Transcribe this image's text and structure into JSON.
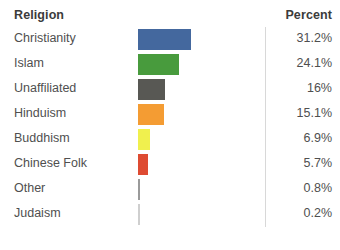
{
  "header": {
    "category_label": "Religion",
    "value_label": "Percent"
  },
  "chart_data": {
    "type": "bar",
    "orientation": "horizontal",
    "title": "",
    "xlabel": "Percent",
    "ylabel": "Religion",
    "grid": false,
    "legend": false,
    "xlim": [
      0,
      31.2
    ],
    "categories": [
      "Christianity",
      "Islam",
      "Unaffiliated",
      "Hinduism",
      "Buddhism",
      "Chinese Folk",
      "Other",
      "Judaism"
    ],
    "values": [
      31.2,
      24.1,
      16,
      15.1,
      6.9,
      5.7,
      0.8,
      0.2
    ],
    "value_labels": [
      "31.2%",
      "24.1%",
      "16%",
      "15.1%",
      "6.9%",
      "5.7%",
      "0.8%",
      "0.2%"
    ],
    "colors": [
      "#44689e",
      "#489b3d",
      "#585854",
      "#f49c33",
      "#f0f04e",
      "#de4b32",
      "#9a9a9a",
      "#bdbdbd"
    ],
    "rows": [
      {
        "label": "Christianity",
        "value": 31.2,
        "value_label": "31.2%",
        "color": "#44689e"
      },
      {
        "label": "Islam",
        "value": 24.1,
        "value_label": "24.1%",
        "color": "#489b3d"
      },
      {
        "label": "Unaffiliated",
        "value": 16,
        "value_label": "16%",
        "color": "#585854"
      },
      {
        "label": "Hinduism",
        "value": 15.1,
        "value_label": "15.1%",
        "color": "#f49c33"
      },
      {
        "label": "Buddhism",
        "value": 6.9,
        "value_label": "6.9%",
        "color": "#f0f04e"
      },
      {
        "label": "Chinese Folk",
        "value": 5.7,
        "value_label": "5.7%",
        "color": "#de4b32"
      },
      {
        "label": "Other",
        "value": 0.8,
        "value_label": "0.8%",
        "color": "#9a9a9a"
      },
      {
        "label": "Judaism",
        "value": 0.2,
        "value_label": "0.2%",
        "color": "#cfcfcf"
      }
    ]
  },
  "scale": {
    "px_per_unit": 1.7,
    "bar_origin_x": 138
  }
}
